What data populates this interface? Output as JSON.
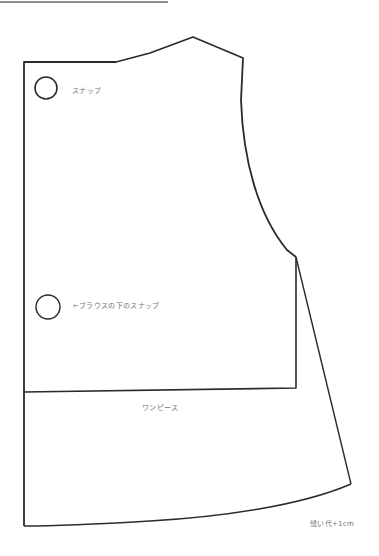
{
  "colors": {
    "line": "#2b2b2b",
    "top_rule": "#6a6a6a",
    "label": "#777777",
    "background": "#ffffff"
  },
  "labels": {
    "snap_upper": "スナップ",
    "snap_lower": "←ブラウスの下のスナップ",
    "piece_name": "ワンピース",
    "seam_allowance": "縫い代+1cm"
  },
  "shapes": {
    "top_rule": {
      "x1": 0,
      "y1": 2,
      "x2": 168,
      "y2": 2
    },
    "snap_upper": {
      "cx": 46,
      "cy": 88,
      "r": 11
    },
    "snap_lower": {
      "cx": 48,
      "cy": 307,
      "r": 12
    }
  }
}
